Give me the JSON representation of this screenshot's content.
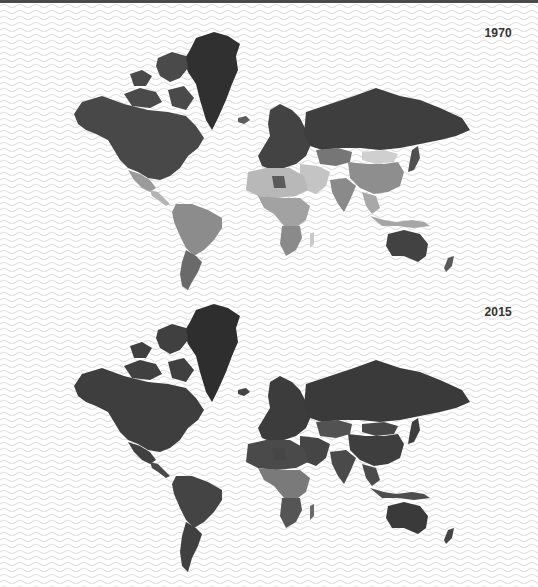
{
  "colors": {
    "sea_background": "#ffffff",
    "wave_line": "#e2e2e2",
    "top_strip": "#4a4a4a",
    "label_text": "#333333"
  },
  "maps": [
    {
      "year_label": "1970",
      "shades": {
        "greenland": "#303030",
        "north_america": "#484848",
        "arctic_canada": "#4a4a4a",
        "mexico": "#9a9a9a",
        "central_america": "#b4b4b4",
        "south_america_north": "#8c8c8c",
        "south_america_south": "#6a6a6a",
        "europe": "#434343",
        "russia": "#3e3e3e",
        "north_africa": "#b8b8b8",
        "libya": "#5a5a5a",
        "sub_saharan_africa": "#a2a2a2",
        "southern_africa": "#8a8a8a",
        "middle_east": "#c4c4c4",
        "central_asia": "#767676",
        "mongolia": "#cfcfcf",
        "china": "#8e8e8e",
        "india": "#8a8a8a",
        "southeast_asia": "#a8a8a8",
        "japan": "#505050",
        "indonesia": "#a6a6a6",
        "australia": "#424242",
        "new_zealand": "#5a5a5a",
        "madagascar": "#c8c8c8",
        "iceland": "#5c5c5c"
      }
    },
    {
      "year_label": "2015",
      "shades": {
        "greenland": "#2e2e2e",
        "north_america": "#3e3e3e",
        "arctic_canada": "#404040",
        "mexico": "#404040",
        "central_america": "#4a4a4a",
        "south_america_north": "#444444",
        "south_america_south": "#404040",
        "europe": "#3c3c3c",
        "russia": "#3a3a3a",
        "north_africa": "#4a4a4a",
        "libya": "#464646",
        "sub_saharan_africa": "#7a7a7a",
        "southern_africa": "#555555",
        "middle_east": "#454545",
        "central_asia": "#525252",
        "mongolia": "#474747",
        "china": "#3e3e3e",
        "india": "#4a4a4a",
        "southeast_asia": "#4c4c4c",
        "japan": "#3e3e3e",
        "indonesia": "#4e4e4e",
        "australia": "#3a3a3a",
        "new_zealand": "#444444",
        "madagascar": "#6a6a6a",
        "iceland": "#444444"
      }
    }
  ]
}
